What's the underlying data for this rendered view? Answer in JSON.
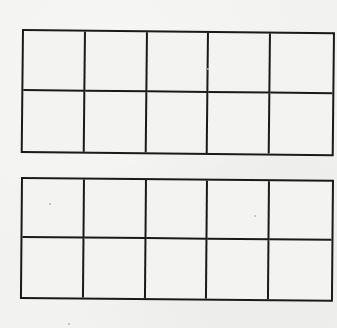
{
  "worksheet": {
    "title": "",
    "frames": [
      {
        "id": "ten-frame-1",
        "rows": 2,
        "columns": 5,
        "cells": [
          [
            "",
            "",
            "",
            "",
            ""
          ],
          [
            "",
            "",
            "",
            "",
            ""
          ]
        ]
      },
      {
        "id": "ten-frame-2",
        "rows": 2,
        "columns": 5,
        "cells": [
          [
            "",
            "",
            "",
            "",
            ""
          ],
          [
            "",
            "",
            "",
            "",
            ""
          ]
        ]
      }
    ]
  },
  "colors": {
    "paper": "#f2f2f0",
    "line": "#1a1a1a"
  }
}
